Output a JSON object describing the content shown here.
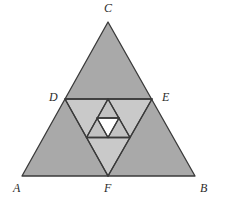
{
  "figure": {
    "canvas": {
      "width": 226,
      "height": 205,
      "background": "#ffffff"
    },
    "colors": {
      "outer_fill": "#a9a9a9",
      "level2_fill": "#c9c9c9",
      "level3_fill": "#c2c2c2",
      "level4_fill": "#cfcfcf",
      "hole_fill": "#ffffff",
      "stroke": "#3a3a3a",
      "label_color": "#2b2b2b"
    },
    "stroke_width": 1.3,
    "vertices": {
      "A": {
        "label": "A",
        "x": 22,
        "y": 176,
        "label_x": 14,
        "label_y": 183
      },
      "B": {
        "label": "B",
        "x": 195,
        "y": 176,
        "label_x": 199,
        "label_y": 183
      },
      "C": {
        "label": "C",
        "x": 108,
        "y": 22,
        "label_x": 104,
        "label_y": 4
      },
      "D": {
        "label": "D",
        "x": 65,
        "y": 99,
        "label_x": 50,
        "label_y": 92
      },
      "E": {
        "label": "E",
        "x": 152,
        "y": 99,
        "label_x": 161,
        "label_y": 92
      },
      "F": {
        "label": "F",
        "x": 108,
        "y": 176,
        "label_x": 105,
        "label_y": 183
      }
    },
    "polygons": {
      "outer_triangle": "22,176 195,176 108,22",
      "level2_triangle": "65,99 152,99 108,176",
      "level3_triangle": "86.5,137.5 130,137.5 108,99",
      "level4_triangle": "97,118 119,118 108,137.5"
    },
    "lines": {
      "DE": {
        "x1": 65,
        "y1": 99,
        "x2": 152,
        "y2": 99
      },
      "DF": {
        "x1": 65,
        "y1": 99,
        "x2": 108,
        "y2": 176
      },
      "EF": {
        "x1": 152,
        "y1": 99,
        "x2": 108,
        "y2": 176
      },
      "L3_base": {
        "x1": 86.5,
        "y1": 137.5,
        "x2": 130,
        "y2": 137.5
      },
      "L3_left": {
        "x1": 86.5,
        "y1": 137.5,
        "x2": 108,
        "y2": 99
      },
      "L3_right": {
        "x1": 130,
        "y1": 137.5,
        "x2": 108,
        "y2": 99
      },
      "L4_top": {
        "x1": 97,
        "y1": 118,
        "x2": 119,
        "y2": 118
      },
      "L4_left": {
        "x1": 97,
        "y1": 118,
        "x2": 108,
        "y2": 137.5
      },
      "L4_right": {
        "x1": 119,
        "y1": 118,
        "x2": 108,
        "y2": 137.5
      }
    },
    "labels_order": [
      "C",
      "D",
      "E",
      "A",
      "F",
      "B"
    ]
  }
}
